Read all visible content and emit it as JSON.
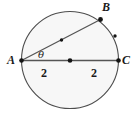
{
  "figure": {
    "background_color": "#ffffff",
    "circle": {
      "name": "circle",
      "center": {
        "x": 70,
        "y": 60
      },
      "radius": 48.5,
      "fill_color": "#f7f7f7",
      "stroke_color": "#4d4d4d",
      "stroke_width": 1.1
    },
    "points": [
      {
        "id": "A",
        "label": "A",
        "x": 21.5,
        "y": 60.5,
        "label_x": 11,
        "label_y": 64,
        "marker": true
      },
      {
        "id": "O",
        "label": "",
        "x": 70,
        "y": 60.5,
        "label_x": 70,
        "label_y": 60,
        "marker": true
      },
      {
        "id": "C",
        "label": "C",
        "x": 118.5,
        "y": 60.5,
        "label_x": 126,
        "label_y": 64,
        "marker": true
      },
      {
        "id": "B",
        "label": "B",
        "x": 100.5,
        "y": 19.5,
        "label_x": 106,
        "label_y": 11,
        "marker": true
      },
      {
        "id": "M_AB",
        "label": "",
        "x": 61.5,
        "y": 40.0,
        "label_x": 0,
        "label_y": 0,
        "marker": true
      },
      {
        "id": "M_BC",
        "label": "",
        "x": 115.0,
        "y": 36.0,
        "label_x": 0,
        "label_y": 0,
        "marker": true
      }
    ],
    "segments": [
      {
        "id": "AC",
        "from": "A",
        "to": "C",
        "stroke_color": "#555555",
        "stroke_width": 1.3
      },
      {
        "id": "AB",
        "from": "A",
        "to": "B",
        "stroke_color": "#555555",
        "stroke_width": 1.3
      }
    ],
    "labels": {
      "point_a": "A",
      "point_b": "B",
      "point_c": "C",
      "angle": "θ",
      "segment_ao_length": "2",
      "segment_oc_length": "2"
    },
    "label_positions": {
      "angle": {
        "x": 41,
        "y": 58
      },
      "segment_ao_length": {
        "x": 44,
        "y": 77
      },
      "segment_oc_length": {
        "x": 94,
        "y": 77
      }
    },
    "colors": {
      "ink": "#1a1a1a",
      "line": "#555555",
      "circle_stroke": "#4d4d4d",
      "circle_fill": "#f7f7f7",
      "page": "#ffffff"
    }
  }
}
